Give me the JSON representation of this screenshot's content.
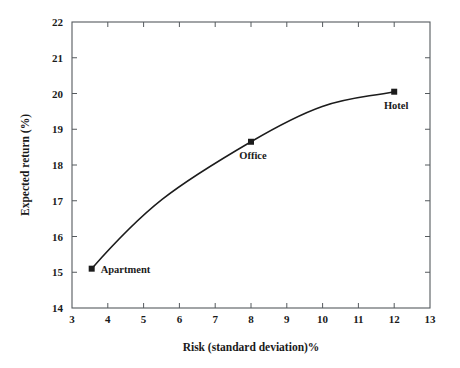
{
  "chart_data": {
    "type": "line",
    "title": "",
    "subtitle": "",
    "xlabel": "Risk (standard deviation)%",
    "ylabel": "Expected return (%)",
    "xlim": [
      3,
      13
    ],
    "ylim": [
      14,
      22
    ],
    "xticks": [
      3,
      4,
      5,
      6,
      7,
      8,
      9,
      10,
      11,
      12,
      13
    ],
    "yticks": [
      14,
      15,
      16,
      17,
      18,
      19,
      20,
      21,
      22
    ],
    "xtick_labels": [
      "3",
      "4",
      "5",
      "6",
      "7",
      "8",
      "9",
      "10",
      "11",
      "12",
      "13"
    ],
    "ytick_labels": [
      "14",
      "15",
      "16",
      "17",
      "18",
      "19",
      "20",
      "21",
      "22"
    ],
    "grid": false,
    "legend": "none",
    "series": [
      {
        "name": "Risk-return frontier",
        "marker": "square",
        "color": "#1c1c1c",
        "points": [
          {
            "label": "Apartment",
            "x": 3.55,
            "y": 15.1,
            "label_position": "right"
          },
          {
            "label": "Office",
            "x": 8.0,
            "y": 18.65,
            "label_position": "below"
          },
          {
            "label": "Hotel",
            "x": 12.0,
            "y": 20.05,
            "label_position": "below"
          }
        ]
      }
    ],
    "annotations": [
      {
        "text": "Apartment",
        "x": 3.55,
        "y": 15.1
      },
      {
        "text": "Office",
        "x": 8.0,
        "y": 18.65
      },
      {
        "text": "Hotel",
        "x": 12.0,
        "y": 20.05
      }
    ],
    "colors": {
      "curve": "#1c1c1c",
      "marker": "#1c1c1c",
      "frame": "#555a5e",
      "text": "#1a1a1a",
      "background": "#ffffff"
    }
  }
}
